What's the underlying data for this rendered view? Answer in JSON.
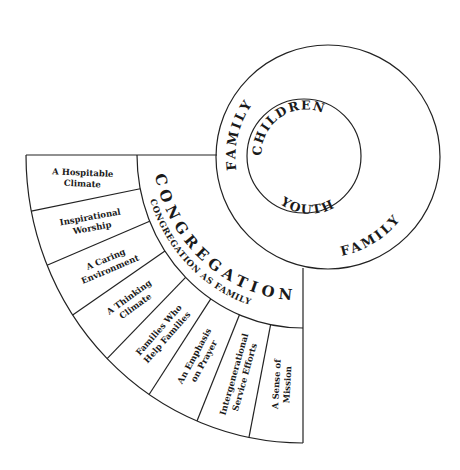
{
  "diagram": {
    "colors": {
      "line": "#222222",
      "text": "#1a1a1a",
      "background": "#ffffff"
    },
    "circles": {
      "outer_top_label": "FAMILY",
      "outer_bottom_label": "FAMILY",
      "inner_top_label": "CHILDREN",
      "inner_bottom_label": "YOUTH"
    },
    "congregation": {
      "title": "CONGREGATION",
      "subtitle": "CONGREGATION AS FAMILY"
    },
    "sections": [
      {
        "line1": "A Hospitable",
        "line2": "Climate"
      },
      {
        "line1": "Inspirational",
        "line2": "Worship"
      },
      {
        "line1": "A Caring",
        "line2": "Environment"
      },
      {
        "line1": "A Thinking",
        "line2": "Climate"
      },
      {
        "line1": "Families Who",
        "line2": "Help Families"
      },
      {
        "line1": "An Emphasis",
        "line2": "on Prayer"
      },
      {
        "line1": "Intergenerational",
        "line2": "Service Efforts"
      },
      {
        "line1": "A Sense of",
        "line2": "Mission"
      }
    ]
  }
}
